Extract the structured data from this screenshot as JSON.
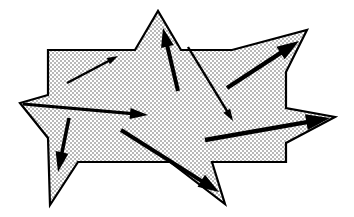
{
  "figure": {
    "canvas": {
      "width": 354,
      "height": 217,
      "background": "#ffffff"
    },
    "shape": {
      "name": "star-polygon",
      "fill_pattern": "dotted-halftone",
      "fill_color": "#c8c8c8",
      "fill_background": "#ffffff",
      "stroke_color": "#000000",
      "stroke_width": 2.2,
      "points": "48,50 135,50 158,11 181,50 232,50 307,30 286,72 286,108 335,117 286,143 286,162 212,162 225,204 170,162 78,162 50,205 48,138 20,103 48,95"
    },
    "arrows": [
      {
        "name": "arrow-upper-left",
        "x1": 67,
        "y1": 83,
        "x2": 118,
        "y2": 56,
        "width": 2.4,
        "head_length": 11,
        "head_width": 7
      },
      {
        "name": "arrow-top-vertical",
        "x1": 178,
        "y1": 91,
        "x2": 163,
        "y2": 28,
        "width": 4.0,
        "head_length": 19,
        "head_width": 13
      },
      {
        "name": "arrow-down-right",
        "x1": 188,
        "y1": 47,
        "x2": 233,
        "y2": 121,
        "width": 2.4,
        "head_length": 12,
        "head_width": 8
      },
      {
        "name": "arrow-up-right",
        "x1": 227,
        "y1": 88,
        "x2": 299,
        "y2": 41,
        "width": 4.4,
        "head_length": 22,
        "head_width": 15
      },
      {
        "name": "arrow-left-to-right",
        "x1": 23,
        "y1": 104,
        "x2": 148,
        "y2": 115,
        "width": 3.2,
        "head_length": 18,
        "head_width": 11
      },
      {
        "name": "arrow-down-left",
        "x1": 69,
        "y1": 118,
        "x2": 58,
        "y2": 172,
        "width": 3.6,
        "head_length": 20,
        "head_width": 13
      },
      {
        "name": "arrow-diagonal-down",
        "x1": 121,
        "y1": 130,
        "x2": 219,
        "y2": 192,
        "width": 4.0,
        "head_length": 21,
        "head_width": 14
      },
      {
        "name": "arrow-right-point",
        "x1": 205,
        "y1": 140,
        "x2": 330,
        "y2": 118,
        "width": 4.4,
        "head_length": 24,
        "head_width": 16
      }
    ]
  }
}
